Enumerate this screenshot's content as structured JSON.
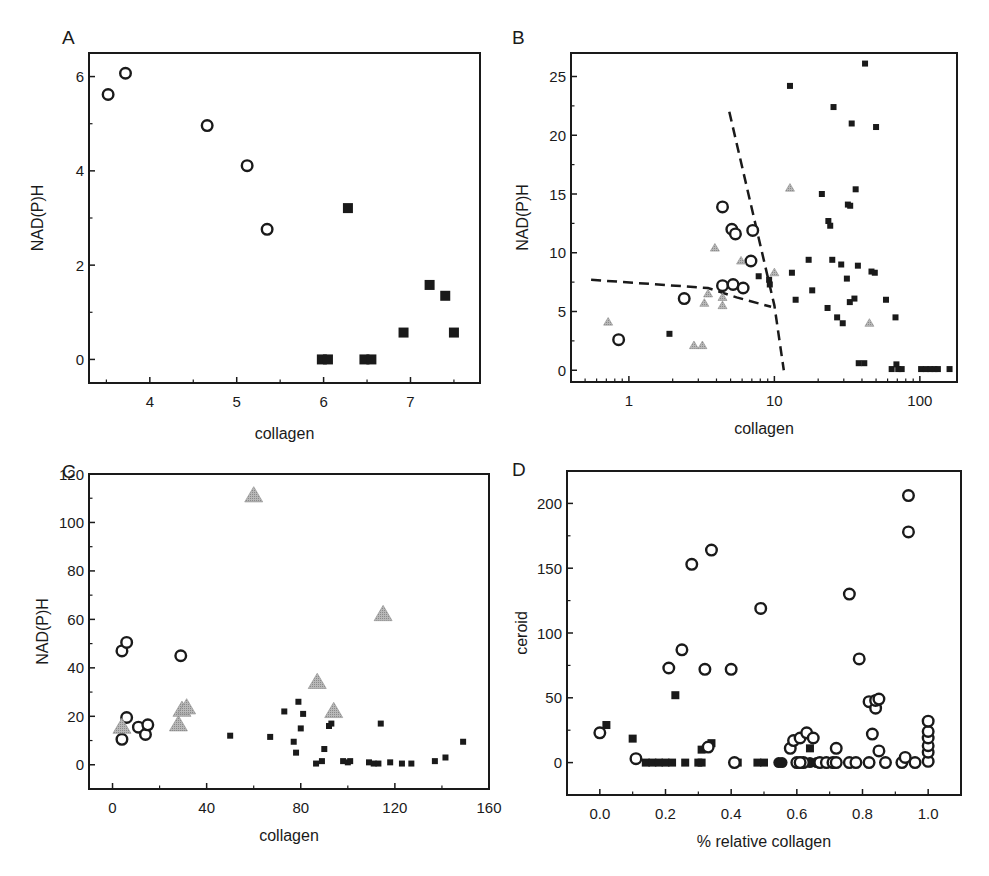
{
  "figure": {
    "panels": [
      "A",
      "B",
      "C",
      "D"
    ],
    "colors": {
      "ink": "#1a1a1a",
      "triangle_fill": "#a8a8a8",
      "triangle_stroke": "#8c8c8c",
      "background": "#ffffff"
    }
  },
  "chart_data": [
    {
      "panel": "A",
      "type": "scatter",
      "title": "",
      "xlabel": "collagen",
      "ylabel": "NAD(P)H",
      "xscale": "linear",
      "xlim": [
        3.3,
        7.8
      ],
      "ylim": [
        -0.5,
        6.5
      ],
      "xticks": [
        4,
        5,
        6,
        7
      ],
      "xtick_labels": [
        "4",
        "5",
        "6",
        "7"
      ],
      "xminor": [
        3.5,
        4.5,
        5.5,
        6.5,
        7.5
      ],
      "yticks": [
        0,
        2,
        4,
        6
      ],
      "ytick_labels": [
        "0",
        "2",
        "4",
        "6"
      ],
      "yminor": [
        1,
        3,
        5
      ],
      "grid": false,
      "legend": null,
      "frame": {
        "left": 89,
        "right": 480,
        "top": 53,
        "bottom": 383
      },
      "series": [
        {
          "name": "open circles",
          "marker": "circle-open",
          "size": 6.5,
          "points": [
            [
              3.52,
              5.62
            ],
            [
              3.72,
              6.07
            ],
            [
              4.66,
              4.96
            ],
            [
              5.12,
              4.11
            ],
            [
              5.35,
              2.76
            ]
          ]
        },
        {
          "name": "filled squares",
          "marker": "square-filled",
          "size": 10,
          "points": [
            [
              5.98,
              0
            ],
            [
              6.05,
              0
            ],
            [
              6.28,
              3.21
            ],
            [
              6.47,
              0
            ],
            [
              6.55,
              0
            ],
            [
              6.92,
              0.57
            ],
            [
              7.22,
              1.58
            ],
            [
              7.4,
              1.35
            ],
            [
              7.5,
              0.57
            ]
          ]
        }
      ]
    },
    {
      "panel": "B",
      "type": "scatter",
      "title": "",
      "xlabel": "collagen",
      "ylabel": "NAD(P)H",
      "xscale": "log",
      "xlim": [
        0.4,
        180
      ],
      "ylim": [
        -1,
        27
      ],
      "xticks": [
        1,
        10,
        100
      ],
      "xtick_labels": [
        "1",
        "10",
        "100"
      ],
      "yticks": [
        0,
        5,
        10,
        15,
        20,
        25
      ],
      "ytick_labels": [
        "0",
        "5",
        "10",
        "15",
        "20",
        "25"
      ],
      "yminor": [
        2.5,
        7.5,
        12.5,
        17.5,
        22.5
      ],
      "grid": false,
      "legend": null,
      "frame": {
        "left": 571,
        "right": 957,
        "top": 53,
        "bottom": 382
      },
      "dashed_lines": [
        {
          "points": [
            [
              0.55,
              7.7
            ],
            [
              3.5,
              7.0
            ],
            [
              5.5,
              6.2
            ],
            [
              9.5,
              5.4
            ]
          ]
        },
        {
          "points": [
            [
              4.9,
              22.0
            ],
            [
              10.0,
              5.5
            ],
            [
              11.6,
              0.0
            ]
          ]
        }
      ],
      "series": [
        {
          "name": "open circles",
          "marker": "circle-open",
          "size": 6.5,
          "points": [
            [
              0.85,
              2.6
            ],
            [
              2.4,
              6.1
            ],
            [
              4.4,
              13.9
            ],
            [
              5.1,
              12.0
            ],
            [
              5.4,
              11.6
            ],
            [
              7.1,
              11.9
            ],
            [
              6.9,
              9.3
            ],
            [
              4.4,
              7.2
            ],
            [
              5.2,
              7.3
            ],
            [
              6.1,
              7.0
            ]
          ]
        },
        {
          "name": "gray triangles",
          "marker": "triangle-gray",
          "size": 4.5,
          "points": [
            [
              0.72,
              4.1
            ],
            [
              2.8,
              2.1
            ],
            [
              3.2,
              2.1
            ],
            [
              3.3,
              5.7
            ],
            [
              3.5,
              6.5
            ],
            [
              3.9,
              10.4
            ],
            [
              4.4,
              6.2
            ],
            [
              4.4,
              5.5
            ],
            [
              5.9,
              9.3
            ],
            [
              10.0,
              8.3
            ],
            [
              12.8,
              15.5
            ],
            [
              45,
              4.0
            ]
          ]
        },
        {
          "name": "filled squares",
          "marker": "square-filled",
          "size": 6,
          "points": [
            [
              1.9,
              3.1
            ],
            [
              7.8,
              8.0
            ],
            [
              9.2,
              7.7
            ],
            [
              9.3,
              7.3
            ],
            [
              12.8,
              24.2
            ],
            [
              13.2,
              8.3
            ],
            [
              14.0,
              6.0
            ],
            [
              17.2,
              9.4
            ],
            [
              18.2,
              6.8
            ],
            [
              21.2,
              15.0
            ],
            [
              23.2,
              5.3
            ],
            [
              23.5,
              12.7
            ],
            [
              24.2,
              12.3
            ],
            [
              25.5,
              22.4
            ],
            [
              25.0,
              9.4
            ],
            [
              27.0,
              4.5
            ],
            [
              28.8,
              9.0
            ],
            [
              29.5,
              4.0
            ],
            [
              31.5,
              7.8
            ],
            [
              32.0,
              14.1
            ],
            [
              33.2,
              14.0
            ],
            [
              34.0,
              21.0
            ],
            [
              33.0,
              5.8
            ],
            [
              35.5,
              6.1
            ],
            [
              36.2,
              15.4
            ],
            [
              37.5,
              8.9
            ],
            [
              38.0,
              0.6
            ],
            [
              41.5,
              0.6
            ],
            [
              42.0,
              26.1
            ],
            [
              46.5,
              8.4
            ],
            [
              49.0,
              8.3
            ],
            [
              50.0,
              20.7
            ],
            [
              58.5,
              6.0
            ],
            [
              64,
              0.1
            ],
            [
              68,
              4.5
            ],
            [
              69,
              0.5
            ],
            [
              71,
              0.1
            ],
            [
              75,
              0.1
            ],
            [
              102,
              0.1
            ],
            [
              110,
              0.1
            ],
            [
              118,
              0.1
            ],
            [
              126,
              0.1
            ],
            [
              133,
              0.1
            ],
            [
              160,
              0.1
            ]
          ]
        }
      ]
    },
    {
      "panel": "C",
      "type": "scatter",
      "title": "",
      "xlabel": "collagen",
      "ylabel": "NAD(P)H",
      "xscale": "linear",
      "xlim": [
        -10,
        160
      ],
      "ylim": [
        -10,
        120
      ],
      "xticks": [
        0,
        40,
        80,
        120,
        160
      ],
      "xtick_labels": [
        "0",
        "40",
        "80",
        "120",
        "160"
      ],
      "xminor": [
        20,
        60,
        100,
        140
      ],
      "yticks": [
        0,
        20,
        40,
        60,
        80,
        100,
        120
      ],
      "ytick_labels": [
        "0",
        "20",
        "40",
        "60",
        "80",
        "100",
        "120"
      ],
      "yminor": [
        10,
        30,
        50,
        70,
        90,
        110
      ],
      "grid": false,
      "legend": null,
      "frame": {
        "left": 89,
        "right": 489,
        "top": 474,
        "bottom": 789
      },
      "series": [
        {
          "name": "open circles",
          "marker": "circle-open",
          "size": 6.5,
          "points": [
            [
              4,
              10.5
            ],
            [
              4,
              47
            ],
            [
              6,
              50.5
            ],
            [
              6,
              19.5
            ],
            [
              11,
              15.5
            ],
            [
              14,
              12.5
            ],
            [
              15,
              16.5
            ],
            [
              29,
              45
            ]
          ]
        },
        {
          "name": "gray triangles",
          "marker": "triangle-gray",
          "size": 9,
          "points": [
            [
              4,
              15.5
            ],
            [
              28,
              16.5
            ],
            [
              29.5,
              22.5
            ],
            [
              31.5,
              23.5
            ],
            [
              60,
              111
            ],
            [
              87,
              34
            ],
            [
              94,
              22
            ],
            [
              115,
              62
            ]
          ]
        },
        {
          "name": "filled squares",
          "marker": "square-filled",
          "size": 6,
          "points": [
            [
              50,
              12
            ],
            [
              67,
              11.5
            ],
            [
              73,
              22
            ],
            [
              77,
              9.5
            ],
            [
              78,
              5
            ],
            [
              79,
              26
            ],
            [
              80,
              15
            ],
            [
              81,
              21
            ],
            [
              86.5,
              0.5
            ],
            [
              89,
              1.5
            ],
            [
              90,
              6.5
            ],
            [
              92,
              16
            ],
            [
              93,
              17
            ],
            [
              98,
              1.5
            ],
            [
              100,
              1
            ],
            [
              101,
              1.5
            ],
            [
              109,
              1
            ],
            [
              111,
              0.5
            ],
            [
              113,
              0.5
            ],
            [
              114,
              17
            ],
            [
              118,
              1
            ],
            [
              123,
              0.5
            ],
            [
              127,
              0.5
            ],
            [
              137,
              1.5
            ],
            [
              141.5,
              3
            ],
            [
              149,
              9.5
            ]
          ]
        }
      ]
    },
    {
      "panel": "D",
      "type": "scatter",
      "title": "",
      "xlabel": "% relative collagen",
      "ylabel": "ceroid",
      "xscale": "linear",
      "xlim": [
        -0.1,
        1.1
      ],
      "ylim": [
        -25,
        225
      ],
      "xticks": [
        0.0,
        0.2,
        0.4,
        0.6,
        0.8,
        1.0
      ],
      "xtick_labels": [
        "0.0",
        "0.2",
        "0.4",
        "0.6",
        "0.8",
        "1.0"
      ],
      "xminor": [
        0.1,
        0.3,
        0.5,
        0.7,
        0.9
      ],
      "yticks": [
        0,
        50,
        100,
        150,
        200
      ],
      "ytick_labels": [
        "0",
        "50",
        "100",
        "150",
        "200"
      ],
      "yminor": [
        25,
        75,
        125,
        175
      ],
      "grid": false,
      "legend": null,
      "frame": {
        "left": 567,
        "right": 961,
        "top": 471,
        "bottom": 795
      },
      "series": [
        {
          "name": "filled squares",
          "marker": "square-filled",
          "size": 8,
          "points": [
            [
              0.02,
              29
            ],
            [
              0.1,
              18.5
            ],
            [
              0.14,
              0
            ],
            [
              0.16,
              0
            ],
            [
              0.18,
              0
            ],
            [
              0.2,
              0
            ],
            [
              0.22,
              0
            ],
            [
              0.23,
              52
            ],
            [
              0.26,
              0
            ],
            [
              0.3,
              0
            ],
            [
              0.31,
              10
            ],
            [
              0.31,
              0
            ],
            [
              0.34,
              15
            ],
            [
              0.42,
              0
            ],
            [
              0.48,
              0
            ],
            [
              0.5,
              0
            ],
            [
              0.64,
              11
            ]
          ]
        },
        {
          "name": "filled circles",
          "marker": "circle-filled",
          "size": 5.5,
          "points": [
            [
              0.545,
              0
            ],
            [
              0.555,
              0
            ],
            [
              0.62,
              0
            ],
            [
              0.64,
              0
            ],
            [
              0.66,
              0
            ]
          ]
        },
        {
          "name": "open circles",
          "marker": "circle-open",
          "size": 6.5,
          "points": [
            [
              0.0,
              23
            ],
            [
              0.11,
              3
            ],
            [
              0.21,
              73
            ],
            [
              0.25,
              87
            ],
            [
              0.28,
              153
            ],
            [
              0.32,
              72
            ],
            [
              0.34,
              164
            ],
            [
              0.33,
              12
            ],
            [
              0.4,
              72
            ],
            [
              0.41,
              0
            ],
            [
              0.49,
              119
            ],
            [
              0.58,
              11
            ],
            [
              0.59,
              17
            ],
            [
              0.6,
              0
            ],
            [
              0.61,
              19
            ],
            [
              0.62,
              0
            ],
            [
              0.63,
              23
            ],
            [
              0.65,
              19
            ],
            [
              0.61,
              0
            ],
            [
              0.67,
              0
            ],
            [
              0.69,
              0
            ],
            [
              0.71,
              0
            ],
            [
              0.72,
              11
            ],
            [
              0.72,
              0
            ],
            [
              0.76,
              0
            ],
            [
              0.76,
              130
            ],
            [
              0.78,
              0
            ],
            [
              0.79,
              80
            ],
            [
              0.82,
              0
            ],
            [
              0.82,
              47
            ],
            [
              0.83,
              22
            ],
            [
              0.84,
              42
            ],
            [
              0.84,
              48
            ],
            [
              0.85,
              9
            ],
            [
              0.85,
              49
            ],
            [
              0.87,
              0
            ],
            [
              0.92,
              0
            ],
            [
              0.93,
              4
            ],
            [
              0.94,
              206
            ],
            [
              0.94,
              178
            ],
            [
              0.96,
              0
            ],
            [
              1.0,
              1
            ],
            [
              1.0,
              8
            ],
            [
              1.0,
              13
            ],
            [
              1.0,
              19
            ],
            [
              1.0,
              24
            ],
            [
              1.0,
              32
            ]
          ]
        }
      ]
    }
  ]
}
